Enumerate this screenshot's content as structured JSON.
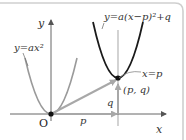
{
  "diagram": {
    "axes": {
      "x_label": "x",
      "y_label": "y",
      "origin_label": "O"
    },
    "curves": [
      {
        "id": "base",
        "label": "y=ax²",
        "color": "#9a9a9a"
      },
      {
        "id": "translated",
        "label": "y=a(x−p)²+q",
        "color": "#1a1a1a"
      }
    ],
    "axis_of_symmetry_label": "x=p",
    "vertex_label": "(p, q)",
    "shift_labels": {
      "horizontal": "p",
      "vertical": "q"
    },
    "colors": {
      "axis": "#555555",
      "base_curve": "#9a9a9a",
      "translated_curve": "#1a1a1a",
      "arrows": "#a8a8a8",
      "frame": "#cfcfcf"
    }
  }
}
